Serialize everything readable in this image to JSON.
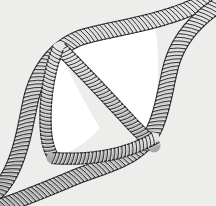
{
  "figure": {
    "caption": "",
    "domain_kind": "diagram",
    "canvas": {
      "width": 216,
      "height": 206
    },
    "colors": {
      "background": "#ededec",
      "aperture_fill": "#ffffff",
      "ribbon_fill": "#b9b9b9",
      "ribbon_fill_light": "#d6d6d6",
      "ribbon_fill_highlight": "#e8e8e8",
      "ribbon_outline": "#262626",
      "coil_stroke": "#2a2a2a"
    },
    "structure": {
      "description": "Four coiled ribbon segments arranged around a central white lens/rhombus shaped opening; two long ribbons run diagonally from the lower-left corner to the upper-right corner, crossing near both corners.",
      "aperture_shape": "lens",
      "ribbon_count": 5
    },
    "ribbons": [
      {
        "id": "ribbon-outer-upper-left",
        "label": "upper-left arc",
        "path": "M -8 196 C 18 176 24 132 30 104 C 36 72 56 44 86 36 C 116 28 150 24 186 10 C 198 5 208 0 216 -4",
        "width": 15,
        "coil_pitch": 4.0,
        "coil_tilt": -26
      },
      {
        "id": "ribbon-outer-lower-right",
        "label": "lower-right arc",
        "path": "M 2 206 C 30 196 54 186 78 176 C 104 166 130 160 146 142 C 160 126 164 96 170 70 C 176 44 192 22 220 4",
        "width": 15,
        "coil_pitch": 4.0,
        "coil_tilt": -26
      },
      {
        "id": "ribbon-diagonal-central",
        "label": "central diagonal strut",
        "path": "M 60 48 C 84 72 110 100 134 126 C 142 134 148 140 154 146",
        "width": 13,
        "coil_pitch": 3.8,
        "coil_tilt": 20
      },
      {
        "id": "ribbon-inner-left",
        "label": "inner left edge",
        "path": "M 58 48 C 48 74 44 104 46 132 C 47 144 50 152 54 158",
        "width": 11,
        "coil_pitch": 3.8,
        "coil_tilt": 12
      },
      {
        "id": "ribbon-inner-bottom",
        "label": "inner bottom edge",
        "path": "M 52 158 C 76 160 104 158 128 150 C 140 146 148 142 154 138",
        "width": 11,
        "coil_pitch": 3.8,
        "coil_tilt": 18
      }
    ],
    "apertures": [
      {
        "id": "aperture-left",
        "label": "left triangular opening",
        "path": "M 60 52 C 50 78 46 106 48 130 C 49 144 52 152 56 156 C 72 152 88 142 100 128 C 86 106 72 78 60 52 Z"
      },
      {
        "id": "aperture-right",
        "label": "right triangular opening",
        "path": "M 66 44 C 96 36 128 30 154 22 C 158 42 160 70 156 100 C 154 118 150 132 146 140 C 120 112 92 74 66 44 Z"
      }
    ],
    "annotations": []
  }
}
